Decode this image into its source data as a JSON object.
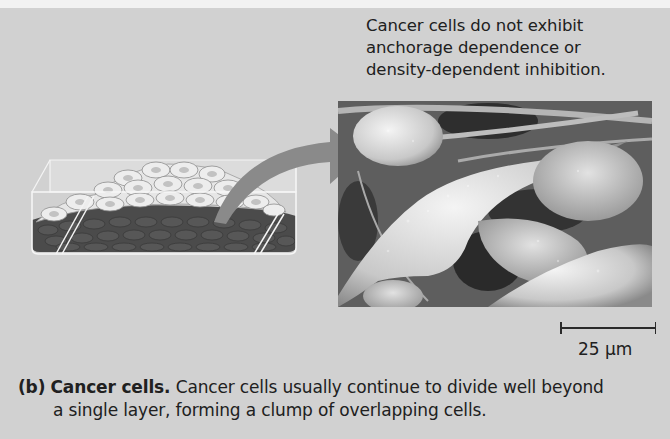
{
  "figure": {
    "annotation_lines": [
      "Cancer cells do not exhibit",
      "anchorage dependence or",
      "density-dependent inhibition."
    ],
    "scale_bar": {
      "label": "25 µm"
    },
    "caption": {
      "panel_label": "(b)",
      "title": "Cancer cells.",
      "text_line1": "Cancer cells usually continue to divide well beyond",
      "text_line2": "a single layer, forming a clump of overlapping cells."
    },
    "illustrations": {
      "dish": "culture-dish-with-overlapping-cancer-cells",
      "arrow": "curved-arrow-to-micrograph",
      "micrograph": "scanning-electron-micrograph-cancer-cells"
    },
    "colors": {
      "background": "#d1d1d1",
      "text": "#202020",
      "arrow": "#8a8a8a",
      "dark_cell_layer": "#4a4a4a",
      "light_cells": "#ececec"
    }
  }
}
